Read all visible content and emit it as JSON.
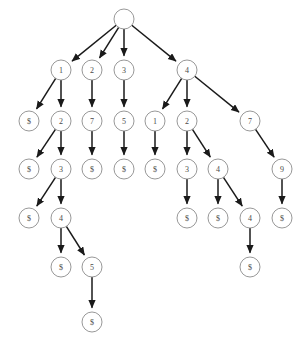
{
  "diagram": {
    "type": "directed-tree",
    "title": "",
    "canvas": {
      "width": 299,
      "height": 343
    },
    "style": {
      "node_fill": "#ffffff",
      "node_stroke": "#8c8c8c",
      "edge_color": "#1a1a1a",
      "label_color": "#4a4a4a",
      "background": "#ffffff",
      "node_radius": 10
    },
    "nodes": [
      {
        "id": "n0",
        "label": "",
        "x": 124,
        "y": 19,
        "depth": 0
      },
      {
        "id": "n1",
        "label": "1",
        "x": 61,
        "y": 70,
        "depth": 1
      },
      {
        "id": "n2",
        "label": "2",
        "x": 92,
        "y": 70,
        "depth": 1
      },
      {
        "id": "n3",
        "label": "3",
        "x": 124,
        "y": 70,
        "depth": 1
      },
      {
        "id": "n4",
        "label": "4",
        "x": 187,
        "y": 70,
        "depth": 1
      },
      {
        "id": "n5",
        "label": "$",
        "x": 29,
        "y": 121,
        "depth": 2
      },
      {
        "id": "n6",
        "label": "2",
        "x": 61,
        "y": 121,
        "depth": 2
      },
      {
        "id": "n7",
        "label": "7",
        "x": 92,
        "y": 121,
        "depth": 2
      },
      {
        "id": "n8",
        "label": "5",
        "x": 124,
        "y": 121,
        "depth": 2
      },
      {
        "id": "n9",
        "label": "1",
        "x": 155,
        "y": 121,
        "depth": 2
      },
      {
        "id": "n10",
        "label": "2",
        "x": 187,
        "y": 121,
        "depth": 2
      },
      {
        "id": "n11",
        "label": "7",
        "x": 250,
        "y": 121,
        "depth": 2
      },
      {
        "id": "n12",
        "label": "$",
        "x": 29,
        "y": 169,
        "depth": 3
      },
      {
        "id": "n13",
        "label": "3",
        "x": 61,
        "y": 169,
        "depth": 3
      },
      {
        "id": "n14",
        "label": "$",
        "x": 92,
        "y": 169,
        "depth": 3
      },
      {
        "id": "n15",
        "label": "$",
        "x": 124,
        "y": 169,
        "depth": 3
      },
      {
        "id": "n16",
        "label": "$",
        "x": 155,
        "y": 169,
        "depth": 3
      },
      {
        "id": "n17",
        "label": "3",
        "x": 187,
        "y": 169,
        "depth": 3
      },
      {
        "id": "n18",
        "label": "4",
        "x": 218,
        "y": 169,
        "depth": 3
      },
      {
        "id": "n19",
        "label": "9",
        "x": 282,
        "y": 169,
        "depth": 3
      },
      {
        "id": "n20",
        "label": "$",
        "x": 29,
        "y": 218,
        "depth": 4
      },
      {
        "id": "n21",
        "label": "4",
        "x": 61,
        "y": 218,
        "depth": 4
      },
      {
        "id": "n22",
        "label": "$",
        "x": 187,
        "y": 218,
        "depth": 4
      },
      {
        "id": "n23",
        "label": "$",
        "x": 218,
        "y": 218,
        "depth": 4
      },
      {
        "id": "n24",
        "label": "4",
        "x": 250,
        "y": 218,
        "depth": 4
      },
      {
        "id": "n25",
        "label": "$",
        "x": 282,
        "y": 218,
        "depth": 4
      },
      {
        "id": "n26",
        "label": "$",
        "x": 61,
        "y": 267,
        "depth": 5
      },
      {
        "id": "n27",
        "label": "5",
        "x": 92,
        "y": 267,
        "depth": 5
      },
      {
        "id": "n28",
        "label": "$",
        "x": 250,
        "y": 267,
        "depth": 5
      },
      {
        "id": "n29",
        "label": "$",
        "x": 92,
        "y": 322,
        "depth": 6
      }
    ],
    "edges": [
      {
        "from": "n0",
        "to": "n1"
      },
      {
        "from": "n0",
        "to": "n2"
      },
      {
        "from": "n0",
        "to": "n3"
      },
      {
        "from": "n0",
        "to": "n4"
      },
      {
        "from": "n1",
        "to": "n5"
      },
      {
        "from": "n1",
        "to": "n6"
      },
      {
        "from": "n2",
        "to": "n7"
      },
      {
        "from": "n3",
        "to": "n8"
      },
      {
        "from": "n4",
        "to": "n9"
      },
      {
        "from": "n4",
        "to": "n10"
      },
      {
        "from": "n4",
        "to": "n11"
      },
      {
        "from": "n6",
        "to": "n12"
      },
      {
        "from": "n6",
        "to": "n13"
      },
      {
        "from": "n7",
        "to": "n14"
      },
      {
        "from": "n8",
        "to": "n15"
      },
      {
        "from": "n9",
        "to": "n16"
      },
      {
        "from": "n10",
        "to": "n17"
      },
      {
        "from": "n10",
        "to": "n18"
      },
      {
        "from": "n11",
        "to": "n19"
      },
      {
        "from": "n13",
        "to": "n20"
      },
      {
        "from": "n13",
        "to": "n21"
      },
      {
        "from": "n17",
        "to": "n22"
      },
      {
        "from": "n18",
        "to": "n23"
      },
      {
        "from": "n18",
        "to": "n24"
      },
      {
        "from": "n19",
        "to": "n25"
      },
      {
        "from": "n21",
        "to": "n26"
      },
      {
        "from": "n21",
        "to": "n27"
      },
      {
        "from": "n24",
        "to": "n28"
      },
      {
        "from": "n27",
        "to": "n29"
      }
    ]
  }
}
